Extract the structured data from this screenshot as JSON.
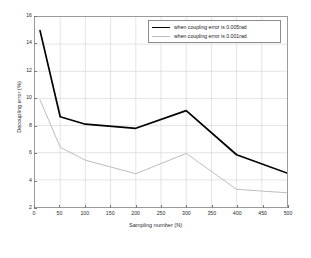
{
  "chart_data": {
    "type": "line",
    "title": "",
    "xlabel": "Sampling number (N)",
    "ylabel": "Decoupling error (%)",
    "xlim": [
      0,
      500
    ],
    "ylim": [
      2,
      16
    ],
    "xticks": [
      0,
      50,
      100,
      150,
      200,
      250,
      300,
      350,
      400,
      450,
      500
    ],
    "yticks": [
      2,
      4,
      6,
      8,
      10,
      12,
      14,
      16
    ],
    "grid": true,
    "legend_position": "top-right-inside",
    "x": [
      10,
      50,
      100,
      200,
      300,
      400,
      500
    ],
    "series": [
      {
        "name": "when coupling error is 0.005rad",
        "values": [
          15.0,
          8.65,
          8.1,
          7.8,
          9.1,
          5.85,
          4.5
        ],
        "color": "#000000",
        "width": 1.7
      },
      {
        "name": "when coupling error is 0.001rad",
        "values": [
          9.9,
          6.4,
          5.45,
          4.45,
          5.95,
          3.3,
          3.05
        ],
        "color": "#bdbdbd",
        "width": 1.0
      }
    ]
  },
  "figure": {
    "background": "#ffffff",
    "axis_color": "#9a9a9a",
    "grid_color": "#d8d8d8"
  }
}
